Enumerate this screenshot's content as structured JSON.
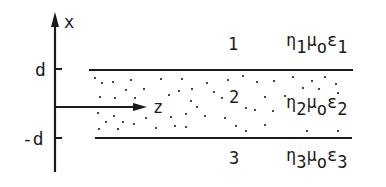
{
  "diagram": {
    "axes": {
      "vertical_label": "x",
      "horizontal_label": "z",
      "tick_top": "d",
      "tick_bottom": "-d"
    },
    "regions": [
      {
        "number": "1",
        "eta": "η",
        "eta_sub": "1",
        "mu": "μ",
        "mu_sub": "o",
        "eps": "ε",
        "eps_sub": "1"
      },
      {
        "number": "2",
        "eta": "η",
        "eta_sub": "2",
        "mu": "μ",
        "mu_sub": "o",
        "eps": "ε",
        "eps_sub": "2"
      },
      {
        "number": "3",
        "eta": "η",
        "eta_sub": "3",
        "mu": "μ",
        "mu_sub": "o",
        "eps": "ε",
        "eps_sub": "3"
      }
    ],
    "colors": {
      "ink": "#1a1a1a",
      "background": "#ffffff"
    }
  }
}
